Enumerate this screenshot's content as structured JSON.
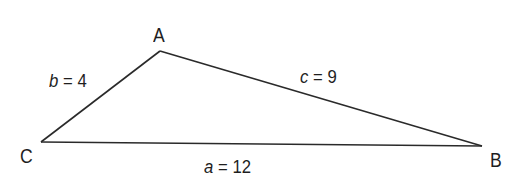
{
  "diagram": {
    "type": "triangle",
    "line_color": "#2a2a2a",
    "background": "#ffffff",
    "vertices": [
      {
        "name": "A",
        "x": 160,
        "y": 51
      },
      {
        "name": "B",
        "x": 482,
        "y": 146
      },
      {
        "name": "C",
        "x": 41,
        "y": 142
      }
    ],
    "vertex_labels": {
      "A": "A",
      "B": "B",
      "C": "C"
    },
    "sides": [
      {
        "id": "a",
        "between": [
          "C",
          "B"
        ],
        "variable": "a",
        "equals": "=",
        "value": "12"
      },
      {
        "id": "b",
        "between": [
          "C",
          "A"
        ],
        "variable": "b",
        "equals": "=",
        "value": "4"
      },
      {
        "id": "c",
        "between": [
          "A",
          "B"
        ],
        "variable": "c",
        "equals": "=",
        "value": "9"
      }
    ]
  }
}
